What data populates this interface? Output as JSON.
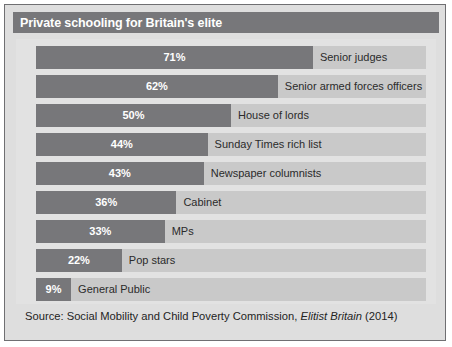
{
  "panel": {
    "title": "Private schooling for Britain's elite",
    "source_prefix": "Source: Social Mobility and Child Poverty Commission, ",
    "source_publication": "Elitist Britain",
    "source_suffix": " (2014)"
  },
  "colors": {
    "panel_background": "#dedede",
    "panel_border": "#6f6f72",
    "title_background": "#77777a",
    "title_text": "#ffffff",
    "plot_background": "#e2e2e2",
    "bar_track": "#c9c9c9",
    "bar_fill": "#77777a",
    "value_text": "#ffffff",
    "category_text": "#2b2b2b",
    "source_text": "#242424"
  },
  "chart_data": {
    "type": "bar",
    "orientation": "horizontal",
    "title": "Private schooling for Britain's elite",
    "xlabel": "",
    "ylabel": "",
    "xlim": [
      0,
      100
    ],
    "grid": false,
    "legend": "none",
    "units": "percent",
    "categories": [
      "Senior judges",
      "Senior armed forces officers",
      "House of lords",
      "Sunday Times rich list",
      "Newspaper columnists",
      "Cabinet",
      "MPs",
      "Pop stars",
      "General Public"
    ],
    "values": [
      71,
      62,
      50,
      44,
      43,
      36,
      33,
      22,
      9
    ],
    "value_labels": [
      "71%",
      "62%",
      "50%",
      "44%",
      "43%",
      "36%",
      "33%",
      "22%",
      "9%"
    ],
    "bars": [
      {
        "label": "Senior judges",
        "value": 71,
        "value_label": "71%"
      },
      {
        "label": "Senior armed forces officers",
        "value": 62,
        "value_label": "62%"
      },
      {
        "label": "House of lords",
        "value": 50,
        "value_label": "50%"
      },
      {
        "label": "Sunday Times rich list",
        "value": 44,
        "value_label": "44%"
      },
      {
        "label": "Newspaper columnists",
        "value": 43,
        "value_label": "43%"
      },
      {
        "label": "Cabinet",
        "value": 36,
        "value_label": "36%"
      },
      {
        "label": "MPs",
        "value": 33,
        "value_label": "33%"
      },
      {
        "label": "Pop stars",
        "value": 22,
        "value_label": "22%"
      },
      {
        "label": "General Public",
        "value": 9,
        "value_label": "9%"
      }
    ]
  }
}
